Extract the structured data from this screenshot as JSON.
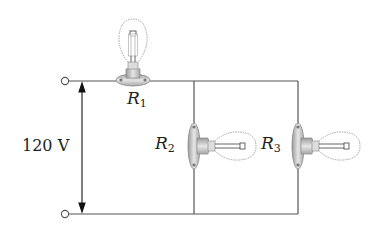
{
  "diagram": {
    "type": "circuit",
    "source": {
      "label": "120 V",
      "value": 120,
      "unit": "V"
    },
    "components": [
      {
        "id": "R1",
        "symbol": "R",
        "subscript": "1",
        "kind": "light-bulb",
        "connection": "series"
      },
      {
        "id": "R2",
        "symbol": "R",
        "subscript": "2",
        "kind": "light-bulb",
        "connection": "parallel"
      },
      {
        "id": "R3",
        "symbol": "R",
        "subscript": "3",
        "kind": "light-bulb",
        "connection": "parallel"
      }
    ],
    "colors": {
      "wire": "#555555",
      "bulb_outline": "#999999",
      "socket": "#b8b8b8",
      "text": "#222222"
    }
  }
}
